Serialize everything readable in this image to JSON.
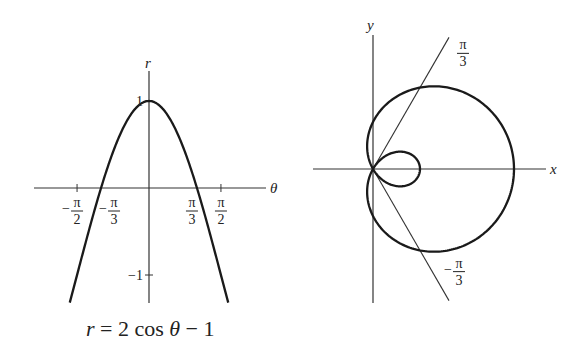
{
  "chart_data": [
    {
      "type": "line",
      "name": "cartesian-graph",
      "title": "",
      "caption": "r = 2 cos θ − 1",
      "equation": "r = 2cos(theta) - 1",
      "xlabel": "θ",
      "ylabel": "r",
      "x_ticks": [
        {
          "value": -1.5708,
          "num": "π",
          "den": "2",
          "sign": "−"
        },
        {
          "value": -1.0472,
          "num": "π",
          "den": "3",
          "sign": "−"
        },
        {
          "value": 1.0472,
          "num": "π",
          "den": "3",
          "sign": ""
        },
        {
          "value": 1.5708,
          "num": "π",
          "den": "2",
          "sign": ""
        }
      ],
      "y_ticks": [
        {
          "value": 1,
          "label": "1"
        },
        {
          "value": -1,
          "label": "−1"
        }
      ],
      "xlim": [
        -2.5,
        2.65
      ],
      "ylim": [
        -1.32,
        1.45
      ],
      "theta_range": [
        -1.73,
        1.73
      ],
      "grid": false,
      "color": "#1a1a1a"
    },
    {
      "type": "line",
      "name": "polar-graph",
      "title": "",
      "equation": "r = 2cos(theta) - 1",
      "xlabel": "x",
      "ylabel": "y",
      "theta_range": [
        0,
        6.2832
      ],
      "ray_lines": [
        {
          "angle": 1.0472,
          "num": "π",
          "den": "3",
          "sign": ""
        },
        {
          "angle": -1.0472,
          "num": "π",
          "den": "3",
          "sign": "−"
        }
      ],
      "xlim": [
        -1.28,
        3.68
      ],
      "ylim": [
        -2.85,
        2.85
      ],
      "grid": false,
      "color": "#1a1a1a"
    }
  ],
  "labels": {
    "left_caption": "r = 2 cos θ − 1",
    "left_xlabel": "θ",
    "left_ylabel": "r",
    "right_xlabel": "x",
    "right_ylabel": "y"
  }
}
